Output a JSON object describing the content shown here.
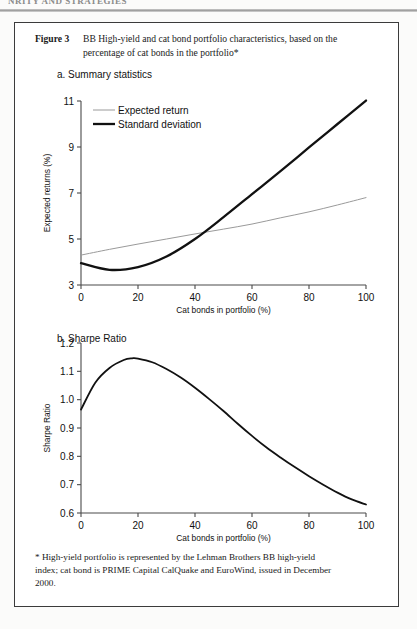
{
  "running_head": "NRITY AND STRATEGIES",
  "figure": {
    "number_label": "Figure 3",
    "caption_line1": "BB High-yield and cat bond portfolio characteristics, based on the",
    "caption_line2": "percentage of cat bonds in the portfolio*",
    "footnote_line1": "* High-yield portfolio is represented by the Lehman Brothers BB high-yield",
    "footnote_line2": "index; cat bond is PRIME Capital CalQuake and EuroWind, issued in December",
    "footnote_line3": "2000."
  },
  "panels": {
    "a": {
      "label": "a. Summary statistics"
    },
    "b": {
      "label": "b. Sharpe Ratio"
    }
  },
  "chart_data": [
    {
      "id": "summary-statistics",
      "type": "line",
      "title": "a. Summary statistics",
      "xlabel": "Cat bonds in portfolio (%)",
      "ylabel": "Expected returns (%)",
      "xlim": [
        0,
        100
      ],
      "ylim": [
        3,
        11
      ],
      "xticks": [
        0,
        20,
        40,
        60,
        80,
        100
      ],
      "yticks": [
        3,
        5,
        7,
        9,
        11
      ],
      "xtick_labels": [
        "0",
        "20",
        "40",
        "60",
        "80",
        "100"
      ],
      "ytick_labels": [
        "3",
        "5",
        "7",
        "9",
        "11"
      ],
      "grid": false,
      "legend_position": "upper-left",
      "x": [
        0,
        10,
        20,
        30,
        40,
        50,
        60,
        70,
        80,
        90,
        100
      ],
      "series": [
        {
          "name": "Expected return",
          "color": "#9a9a9a",
          "width": 1,
          "values": [
            4.3,
            4.55,
            4.78,
            5.0,
            5.22,
            5.43,
            5.65,
            5.92,
            6.18,
            6.48,
            6.8
          ]
        },
        {
          "name": "Standard deviation",
          "color": "#111111",
          "width": 2.3,
          "values": [
            3.95,
            3.66,
            3.78,
            4.24,
            5.0,
            5.95,
            6.95,
            7.95,
            8.98,
            10.0,
            11.02
          ]
        }
      ]
    },
    {
      "id": "sharpe-ratio",
      "type": "line",
      "title": "b. Sharpe Ratio",
      "xlabel": "Cat bonds in portfolio (%)",
      "ylabel": "Sharpe Ratio",
      "xlim": [
        0,
        100
      ],
      "ylim": [
        0.6,
        1.2
      ],
      "xticks": [
        0,
        20,
        40,
        60,
        80,
        100
      ],
      "yticks": [
        0.6,
        0.7,
        0.8,
        0.9,
        1.0,
        1.1,
        1.2
      ],
      "xtick_labels": [
        "0",
        "20",
        "40",
        "60",
        "80",
        "100"
      ],
      "ytick_labels": [
        "0.6",
        "0.7",
        "0.8",
        "0.9",
        "1.0",
        "1.1",
        "1.2"
      ],
      "grid": false,
      "legend_position": "none",
      "x": [
        0,
        5,
        10,
        15,
        18,
        20,
        25,
        30,
        35,
        40,
        45,
        50,
        55,
        60,
        65,
        70,
        75,
        80,
        85,
        90,
        95,
        100
      ],
      "series": [
        {
          "name": "Sharpe Ratio",
          "color": "#111111",
          "width": 1.8,
          "values": [
            0.965,
            1.06,
            1.112,
            1.14,
            1.146,
            1.145,
            1.132,
            1.108,
            1.078,
            1.042,
            1.002,
            0.96,
            0.915,
            0.872,
            0.832,
            0.796,
            0.762,
            0.73,
            0.7,
            0.672,
            0.648,
            0.63
          ]
        }
      ]
    }
  ]
}
